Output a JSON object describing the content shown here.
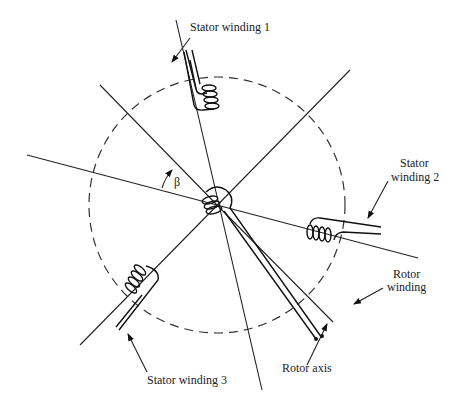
{
  "diagram": {
    "labels": {
      "stator1": "Stator winding 1",
      "stator2_line1": "Stator",
      "stator2_line2": "winding 2",
      "stator3": "Stator winding 3",
      "rotor_winding_line1": "Rotor",
      "rotor_winding_line2": "winding",
      "rotor_axis": "Rotor axis",
      "angle": "β"
    },
    "colors": {
      "stroke": "#222222",
      "background": "#ffffff"
    }
  }
}
